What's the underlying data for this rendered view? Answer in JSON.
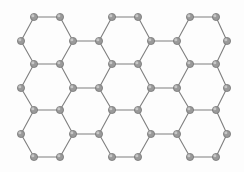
{
  "figure": {
    "caption": "",
    "width": 244,
    "height": 172,
    "background_color": "#fdfdfd",
    "node_fill_color": "#9a9a9a",
    "node_stroke_color": "#6e6e6e",
    "node_highlight_color": "#cfcfcf",
    "edge_color": "#7f7f7f",
    "node_radius": 3.6,
    "edge_width": 1.1
  },
  "lattice": {
    "type": "honeycomb",
    "rows": 3,
    "columns": 4,
    "hexagon_count": 12,
    "node_count": 60,
    "column_x": [
      21,
      34,
      60,
      73,
      99,
      112,
      138,
      151,
      177,
      190,
      216,
      227
    ],
    "row_y": [
      17,
      41,
      64,
      88,
      110,
      134,
      157
    ],
    "nodes": [
      {
        "id": "n01",
        "x": 34,
        "y": 17
      },
      {
        "id": "n02",
        "x": 60,
        "y": 17
      },
      {
        "id": "n03",
        "x": 112,
        "y": 17
      },
      {
        "id": "n04",
        "x": 138,
        "y": 17
      },
      {
        "id": "n05",
        "x": 190,
        "y": 17
      },
      {
        "id": "n06",
        "x": 216,
        "y": 17
      },
      {
        "id": "n07",
        "x": 21,
        "y": 41
      },
      {
        "id": "n08",
        "x": 73,
        "y": 41
      },
      {
        "id": "n09",
        "x": 99,
        "y": 41
      },
      {
        "id": "n10",
        "x": 151,
        "y": 41
      },
      {
        "id": "n11",
        "x": 177,
        "y": 41
      },
      {
        "id": "n12",
        "x": 227,
        "y": 41
      },
      {
        "id": "n13",
        "x": 34,
        "y": 64
      },
      {
        "id": "n14",
        "x": 60,
        "y": 64
      },
      {
        "id": "n15",
        "x": 112,
        "y": 64
      },
      {
        "id": "n16",
        "x": 138,
        "y": 64
      },
      {
        "id": "n17",
        "x": 190,
        "y": 64
      },
      {
        "id": "n18",
        "x": 216,
        "y": 64
      },
      {
        "id": "n19",
        "x": 21,
        "y": 88
      },
      {
        "id": "n20",
        "x": 73,
        "y": 88
      },
      {
        "id": "n21",
        "x": 99,
        "y": 88
      },
      {
        "id": "n22",
        "x": 151,
        "y": 88
      },
      {
        "id": "n23",
        "x": 177,
        "y": 88
      },
      {
        "id": "n24",
        "x": 227,
        "y": 88
      },
      {
        "id": "n25",
        "x": 34,
        "y": 110
      },
      {
        "id": "n26",
        "x": 60,
        "y": 110
      },
      {
        "id": "n27",
        "x": 112,
        "y": 110
      },
      {
        "id": "n28",
        "x": 138,
        "y": 110
      },
      {
        "id": "n29",
        "x": 190,
        "y": 110
      },
      {
        "id": "n30",
        "x": 216,
        "y": 110
      },
      {
        "id": "n31",
        "x": 21,
        "y": 134
      },
      {
        "id": "n32",
        "x": 73,
        "y": 134
      },
      {
        "id": "n33",
        "x": 99,
        "y": 134
      },
      {
        "id": "n34",
        "x": 151,
        "y": 134
      },
      {
        "id": "n35",
        "x": 177,
        "y": 134
      },
      {
        "id": "n36",
        "x": 227,
        "y": 134
      },
      {
        "id": "n37",
        "x": 34,
        "y": 157
      },
      {
        "id": "n38",
        "x": 60,
        "y": 157
      },
      {
        "id": "n39",
        "x": 112,
        "y": 157
      },
      {
        "id": "n40",
        "x": 138,
        "y": 157
      },
      {
        "id": "n41",
        "x": 190,
        "y": 157
      },
      {
        "id": "n42",
        "x": 216,
        "y": 157
      }
    ],
    "edges": [
      [
        "n01",
        "n02"
      ],
      [
        "n03",
        "n04"
      ],
      [
        "n05",
        "n06"
      ],
      [
        "n01",
        "n07"
      ],
      [
        "n02",
        "n08"
      ],
      [
        "n03",
        "n09"
      ],
      [
        "n04",
        "n10"
      ],
      [
        "n05",
        "n11"
      ],
      [
        "n06",
        "n12"
      ],
      [
        "n08",
        "n09"
      ],
      [
        "n10",
        "n11"
      ],
      [
        "n07",
        "n13"
      ],
      [
        "n08",
        "n14"
      ],
      [
        "n09",
        "n15"
      ],
      [
        "n10",
        "n16"
      ],
      [
        "n11",
        "n17"
      ],
      [
        "n12",
        "n18"
      ],
      [
        "n13",
        "n14"
      ],
      [
        "n15",
        "n16"
      ],
      [
        "n17",
        "n18"
      ],
      [
        "n13",
        "n19"
      ],
      [
        "n14",
        "n20"
      ],
      [
        "n15",
        "n21"
      ],
      [
        "n16",
        "n22"
      ],
      [
        "n17",
        "n23"
      ],
      [
        "n18",
        "n24"
      ],
      [
        "n20",
        "n21"
      ],
      [
        "n22",
        "n23"
      ],
      [
        "n19",
        "n25"
      ],
      [
        "n20",
        "n26"
      ],
      [
        "n21",
        "n27"
      ],
      [
        "n22",
        "n28"
      ],
      [
        "n23",
        "n29"
      ],
      [
        "n24",
        "n30"
      ],
      [
        "n25",
        "n26"
      ],
      [
        "n27",
        "n28"
      ],
      [
        "n29",
        "n30"
      ],
      [
        "n25",
        "n31"
      ],
      [
        "n26",
        "n32"
      ],
      [
        "n27",
        "n33"
      ],
      [
        "n28",
        "n34"
      ],
      [
        "n29",
        "n35"
      ],
      [
        "n30",
        "n36"
      ],
      [
        "n32",
        "n33"
      ],
      [
        "n34",
        "n35"
      ],
      [
        "n31",
        "n37"
      ],
      [
        "n32",
        "n38"
      ],
      [
        "n33",
        "n39"
      ],
      [
        "n34",
        "n40"
      ],
      [
        "n35",
        "n41"
      ],
      [
        "n36",
        "n42"
      ],
      [
        "n37",
        "n38"
      ],
      [
        "n39",
        "n40"
      ],
      [
        "n41",
        "n42"
      ]
    ]
  }
}
